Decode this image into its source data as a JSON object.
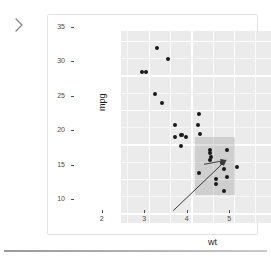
{
  "nav": {
    "expand_icon": "chevron-right-icon"
  },
  "chart_data": {
    "type": "scatter",
    "title": "",
    "xlabel": "wt",
    "ylabel": "mpg",
    "xlim": [
      1.35,
      5.65
    ],
    "ylim": [
      8.6,
      36.4
    ],
    "xticks": [
      2,
      3,
      4,
      5
    ],
    "yticks": [
      10,
      15,
      20,
      25,
      30,
      35
    ],
    "grid": true,
    "legend": "none",
    "points": [
      {
        "wt": 2.2,
        "mpg": 33.9
      },
      {
        "wt": 1.84,
        "mpg": 30.4
      },
      {
        "wt": 1.94,
        "mpg": 30.4
      },
      {
        "wt": 2.46,
        "mpg": 32.4
      },
      {
        "wt": 2.14,
        "mpg": 27.3
      },
      {
        "wt": 2.32,
        "mpg": 26.0
      },
      {
        "wt": 2.62,
        "mpg": 22.8
      },
      {
        "wt": 2.77,
        "mpg": 21.4
      },
      {
        "wt": 2.88,
        "mpg": 21.0
      },
      {
        "wt": 3.15,
        "mpg": 22.8
      },
      {
        "wt": 3.19,
        "mpg": 24.4
      },
      {
        "wt": 3.21,
        "mpg": 21.5
      },
      {
        "wt": 3.44,
        "mpg": 18.7
      },
      {
        "wt": 3.44,
        "mpg": 19.2
      },
      {
        "wt": 3.44,
        "mpg": 17.8
      },
      {
        "wt": 3.46,
        "mpg": 18.1
      },
      {
        "wt": 3.57,
        "mpg": 14.3
      },
      {
        "wt": 3.57,
        "mpg": 15.0
      },
      {
        "wt": 3.73,
        "mpg": 17.3
      },
      {
        "wt": 3.78,
        "mpg": 16.4
      },
      {
        "wt": 3.84,
        "mpg": 15.2
      },
      {
        "wt": 3.85,
        "mpg": 19.2
      },
      {
        "wt": 3.17,
        "mpg": 15.8
      },
      {
        "wt": 3.78,
        "mpg": 13.3
      },
      {
        "wt": 4.07,
        "mpg": 16.7
      },
      {
        "wt": 5.25,
        "mpg": 14.7
      },
      {
        "wt": 5.34,
        "mpg": 10.4
      },
      {
        "wt": 5.42,
        "mpg": 10.4
      },
      {
        "wt": 2.78,
        "mpg": 21.4
      },
      {
        "wt": 2.62,
        "mpg": 21.0
      },
      {
        "wt": 2.77,
        "mpg": 19.7
      }
    ],
    "selection_rect": {
      "x0": 3.08,
      "x1": 4.02,
      "y0": 12.6,
      "y1": 21.1,
      "fill": "#6e6e6e",
      "opacity": 0.22
    },
    "annotations": [
      {
        "name": "long-arrow",
        "x0": 2.58,
        "y0": 10.4,
        "x1": 3.82,
        "y1": 17.7,
        "color": "#3a3a3a"
      },
      {
        "name": "short-arrow",
        "x0": 3.3,
        "y0": 17.1,
        "x1": 3.82,
        "y1": 17.7,
        "color": "#3a3a3a"
      }
    ]
  },
  "colors": {
    "panel": "#ebebeb",
    "grid": "#ffffff",
    "point": "#1a1a1a",
    "axis_text": "#4d4d4d",
    "card_border": "#e2e2e2"
  }
}
